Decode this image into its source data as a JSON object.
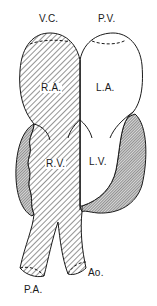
{
  "figure": {
    "type": "anatomical-heart-diagram",
    "style": "line-drawing-hatched",
    "colors": {
      "stroke": "#1a1a1a",
      "background": "#ffffff",
      "hatch_light": "#2a2a2a",
      "hatch_dense": "#3a3a3a"
    }
  },
  "labels": {
    "vena_cava": "V.C.",
    "pulmonary_veins": "P.V.",
    "right_atrium": "R.A.",
    "left_atrium": "L.A.",
    "right_ventricle": "R.V.",
    "left_ventricle": "L.V.",
    "pulmonary_artery": "P.A.",
    "aorta": "Ao."
  },
  "regions": [
    {
      "id": "right-atrium",
      "label": "R.A.",
      "fill": "light-hatch"
    },
    {
      "id": "left-atrium",
      "label": "L.A.",
      "fill": "none"
    },
    {
      "id": "right-ventricle",
      "label": "R.V.",
      "fill": "light-hatch"
    },
    {
      "id": "left-ventricle",
      "label": "L.V.",
      "fill": "none"
    },
    {
      "id": "right-ventricle-wall",
      "fill": "dense-hatch"
    },
    {
      "id": "left-ventricle-wall",
      "fill": "dense-hatch"
    },
    {
      "id": "pulmonary-artery",
      "label": "P.A.",
      "fill": "light-hatch"
    },
    {
      "id": "aorta",
      "label": "Ao.",
      "fill": "light-hatch"
    }
  ]
}
